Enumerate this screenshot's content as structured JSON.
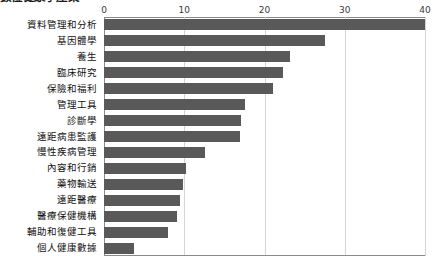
{
  "chart_data": {
    "type": "bar",
    "orientation": "horizontal",
    "title": "數位健康子產業",
    "xlabel": "",
    "ylabel": "",
    "xlim": [
      0,
      40
    ],
    "xticks": [
      0,
      10,
      20,
      30,
      40
    ],
    "grid": true,
    "legend": null,
    "bar_color": "#595959",
    "gridline_color": "#d4d4d4",
    "axis_color": "#8a8a8a",
    "categories": [
      "資料管理和分析",
      "基因體學",
      "養生",
      "臨床研究",
      "保險和福利",
      "管理工具",
      "診斷學",
      "遠距病患監護",
      "慢性疾病管理",
      "內容和行銷",
      "藥物輸送",
      "遠距醫療",
      "醫療保健機構",
      "輔助和復健工具",
      "個人健康數據"
    ],
    "values": [
      40.0,
      27.5,
      23.2,
      22.3,
      21.0,
      17.6,
      17.1,
      17.0,
      12.6,
      10.2,
      9.8,
      9.5,
      9.1,
      8.0,
      3.7
    ]
  }
}
